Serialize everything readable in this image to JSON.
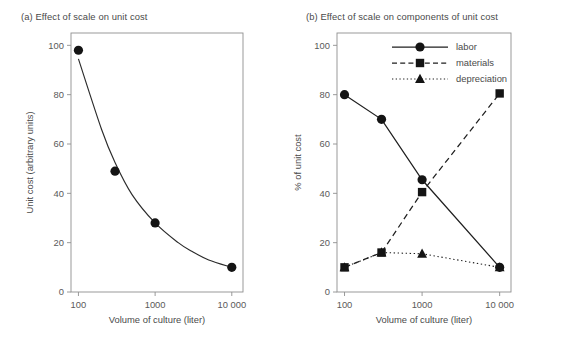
{
  "figure": {
    "panel_a_title": "(a) Effect of scale on unit cost",
    "panel_b_title": "(b) Effect of scale on components of unit cost"
  },
  "chart_data": [
    {
      "type": "line",
      "panel": "a",
      "title": "(a) Effect of scale on unit cost",
      "xlabel": "Volume of culture (liter)",
      "ylabel": "Unit cost (arbitrary units)",
      "xscale": "log",
      "xlim": [
        80,
        14000
      ],
      "ylim": [
        0,
        105
      ],
      "grid": false,
      "legend": "none",
      "xticks": [
        100,
        1000,
        10000
      ],
      "xticklabels": [
        "100",
        "1000",
        "10 000"
      ],
      "yticks": [
        0,
        20,
        40,
        60,
        80,
        100
      ],
      "yticklabels": [
        "0",
        "20",
        "40",
        "60",
        "80",
        "100"
      ],
      "series": [
        {
          "name": "unit cost",
          "marker": "circle",
          "linestyle": "solid",
          "x": [
            100,
            300,
            1000,
            10000
          ],
          "values": [
            98,
            49,
            28,
            10
          ]
        }
      ],
      "fit_curve": {
        "description": "smooth decreasing curve through the points",
        "x": [
          100,
          200,
          300,
          500,
          1000,
          2000,
          3000,
          5000,
          10000
        ],
        "values": [
          94.5,
          66,
          52.5,
          39.5,
          28,
          20,
          16.5,
          13,
          10
        ]
      }
    },
    {
      "type": "line",
      "panel": "b",
      "title": "(b) Effect of scale on components of unit cost",
      "xlabel": "Volume of culture (liter)",
      "ylabel": "% of unit cost",
      "xscale": "log",
      "xlim": [
        80,
        14000
      ],
      "ylim": [
        0,
        105
      ],
      "grid": false,
      "legend": "upper right",
      "xticks": [
        100,
        1000,
        10000
      ],
      "xticklabels": [
        "100",
        "1000",
        "10 000"
      ],
      "yticks": [
        0,
        20,
        40,
        60,
        80,
        100
      ],
      "yticklabels": [
        "0",
        "20",
        "40",
        "60",
        "80",
        "100"
      ],
      "x": [
        100,
        300,
        1000,
        10000
      ],
      "series": [
        {
          "name": "labor",
          "marker": "circle",
          "linestyle": "solid",
          "values": [
            80,
            70,
            45.5,
            10
          ]
        },
        {
          "name": "materials",
          "marker": "square",
          "linestyle": "dashed",
          "values": [
            10,
            16,
            40.5,
            80.5
          ]
        },
        {
          "name": "depreciation",
          "marker": "triangle",
          "linestyle": "dotted",
          "values": [
            10,
            16,
            15.5,
            10
          ]
        }
      ]
    }
  ]
}
